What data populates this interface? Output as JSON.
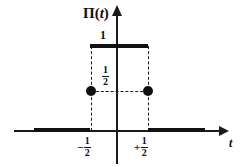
{
  "figure": {
    "kind": "rect-function-plot",
    "function_label_symbol": "Π",
    "function_label_open": "(",
    "function_label_variable": "t",
    "function_label_close": ")",
    "x_axis_label": "t",
    "amplitude_label": "1",
    "midpoint_label_numerator": "1",
    "midpoint_label_denominator": "2",
    "left_tick_sign": "−",
    "left_tick_numerator": "1",
    "left_tick_denominator": "2",
    "right_tick_sign": "+",
    "right_tick_numerator": "1",
    "right_tick_denominator": "2",
    "colors": {
      "trace": "#111111",
      "axis": "#1a1a1a",
      "background": "#ffffff"
    }
  },
  "chart_data": {
    "type": "line",
    "title": "Π(t)",
    "xlabel": "t",
    "ylabel": "Π(t)",
    "xlim": [
      -1.75,
      1.6
    ],
    "ylim": [
      -0.2,
      1.35
    ],
    "grid": false,
    "legend": null,
    "xticks": [
      -0.5,
      0.5
    ],
    "xticklabels": [
      "−1/2",
      "+1/2"
    ],
    "yticks": [
      0.5,
      1
    ],
    "yticklabels": [
      "1/2",
      "1"
    ],
    "series": [
      {
        "name": "Π(t)",
        "kind": "piecewise-step",
        "segments": [
          {
            "x": [
              -1.45,
              -0.5
            ],
            "y": [
              0,
              0
            ]
          },
          {
            "x": [
              -0.5,
              0.5
            ],
            "y": [
              1,
              1
            ]
          },
          {
            "x": [
              0.5,
              1.55
            ],
            "y": [
              0,
              0
            ]
          }
        ]
      }
    ],
    "points": [
      {
        "x": -0.5,
        "y": 0.5,
        "marker": "filled-circle",
        "label": "1/2"
      },
      {
        "x": 0.5,
        "y": 0.5,
        "marker": "filled-circle",
        "label": "1/2"
      }
    ],
    "annotations": [
      {
        "text": "1",
        "x": -0.1,
        "y": 1.08,
        "role": "amplitude-label"
      },
      {
        "text": "1/2",
        "x": -0.12,
        "y": 0.62,
        "role": "midpoint-label"
      },
      {
        "text": "Π(t)",
        "x": -0.4,
        "y": 1.3,
        "role": "function-label"
      },
      {
        "text": "t",
        "x": 1.62,
        "y": -0.1,
        "role": "axis-label"
      }
    ],
    "guides": [
      {
        "kind": "dashed-vertical",
        "x": -0.5,
        "y": [
          0,
          1
        ]
      },
      {
        "kind": "dashed-vertical",
        "x": 0.5,
        "y": [
          0,
          1
        ]
      },
      {
        "kind": "dashed-horizontal",
        "y": 0.5,
        "x": [
          -0.5,
          0.5
        ]
      }
    ]
  }
}
